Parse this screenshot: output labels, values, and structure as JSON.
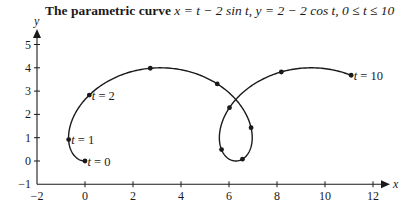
{
  "title": {
    "bold": "The parametric curve",
    "formula": " x = t − 2 sin t, y = 2 − 2 cos t, 0 ≤ t ≤ 10"
  },
  "chart_data": {
    "type": "line",
    "title": "The parametric curve x = t − 2 sin t, y = 2 − 2 cos t, 0 ≤ t ≤ 10",
    "xlabel": "x",
    "ylabel": "y",
    "xlim": [
      -2,
      12.5
    ],
    "ylim": [
      -1,
      5.5
    ],
    "grid": false,
    "legend": null,
    "x_ticks": [
      -2,
      0,
      2,
      4,
      6,
      8,
      10,
      12
    ],
    "y_ticks": [
      -1,
      0,
      1,
      2,
      3,
      4,
      5
    ],
    "parametric": {
      "x": "t - 2*sin(t)",
      "y": "2 - 2*cos(t)",
      "t_range": [
        0,
        10
      ]
    },
    "marked_points": [
      {
        "t": 0,
        "x": 0.0,
        "y": 0.0,
        "label": "t = 0"
      },
      {
        "t": 1,
        "x": -0.68,
        "y": 0.92,
        "label": "t = 1"
      },
      {
        "t": 2,
        "x": 0.18,
        "y": 2.83,
        "label": "t = 2"
      },
      {
        "t": 3,
        "x": 2.72,
        "y": 3.98,
        "label": ""
      },
      {
        "t": 4,
        "x": 5.51,
        "y": 3.31,
        "label": ""
      },
      {
        "t": 5,
        "x": 6.92,
        "y": 1.43,
        "label": ""
      },
      {
        "t": 6,
        "x": 6.56,
        "y": 0.08,
        "label": ""
      },
      {
        "t": 7,
        "x": 5.69,
        "y": 0.49,
        "label": ""
      },
      {
        "t": 8,
        "x": 6.02,
        "y": 2.29,
        "label": ""
      },
      {
        "t": 9,
        "x": 8.18,
        "y": 3.82,
        "label": ""
      },
      {
        "t": 10,
        "x": 11.09,
        "y": 3.68,
        "label": "t = 10"
      }
    ]
  }
}
